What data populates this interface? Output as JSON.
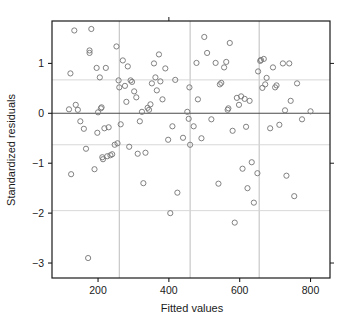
{
  "chart_data": {
    "type": "scatter",
    "title": "",
    "xlabel": "Fitted values",
    "ylabel": "Standardized residuals",
    "xlim": [
      70,
      855
    ],
    "ylim": [
      -3.3,
      1.85
    ],
    "xticks": [
      200,
      400,
      600,
      800
    ],
    "yticks": [
      1,
      0,
      -1,
      -2,
      -3
    ],
    "ytick_labels": [
      "1",
      "0",
      "−1",
      "−2",
      "−3"
    ],
    "xtick_labels": [
      "200",
      "400",
      "600",
      "800"
    ],
    "grid": true,
    "gridlines_v": [
      260,
      460,
      655
    ],
    "gridlines_h": [
      0.67,
      -0.63,
      -1.95
    ],
    "zero_line": 0,
    "legend": "none",
    "marker": "open-circle",
    "marker_color": "#7a7a7a",
    "marker_radius": 2.6,
    "points": [
      [
        118,
        0.08
      ],
      [
        124,
        -1.22
      ],
      [
        133,
        1.66
      ],
      [
        137,
        0.17
      ],
      [
        122,
        0.8
      ],
      [
        143,
        0.07
      ],
      [
        150,
        -0.16
      ],
      [
        160,
        -0.31
      ],
      [
        166,
        -0.71
      ],
      [
        172,
        -2.9
      ],
      [
        176,
        1.21
      ],
      [
        176,
        1.26
      ],
      [
        181,
        1.69
      ],
      [
        190,
        -1.12
      ],
      [
        196,
        0.91
      ],
      [
        198,
        -0.39
      ],
      [
        200,
        0.02
      ],
      [
        205,
        0.72
      ],
      [
        208,
        0.1
      ],
      [
        210,
        0.12
      ],
      [
        212,
        -0.88
      ],
      [
        214,
        -0.92
      ],
      [
        218,
        -0.3
      ],
      [
        222,
        0.91
      ],
      [
        226,
        -0.86
      ],
      [
        230,
        -0.28
      ],
      [
        235,
        -0.84
      ],
      [
        240,
        -0.82
      ],
      [
        247,
        -0.63
      ],
      [
        252,
        1.34
      ],
      [
        255,
        -0.6
      ],
      [
        258,
        0.66
      ],
      [
        260,
        0.52
      ],
      [
        264,
        -0.22
      ],
      [
        270,
        1.06
      ],
      [
        276,
        0.55
      ],
      [
        280,
        0.23
      ],
      [
        284,
        0.94
      ],
      [
        288,
        -0.67
      ],
      [
        292,
        0.66
      ],
      [
        296,
        0.63
      ],
      [
        302,
        0.44
      ],
      [
        308,
        0.32
      ],
      [
        312,
        -0.81
      ],
      [
        318,
        -0.16
      ],
      [
        324,
        0.03
      ],
      [
        328,
        -1.4
      ],
      [
        334,
        -0.79
      ],
      [
        340,
        0.11
      ],
      [
        344,
        0.07
      ],
      [
        348,
        0.18
      ],
      [
        352,
        0.6
      ],
      [
        358,
        1.0
      ],
      [
        362,
        0.72
      ],
      [
        366,
        0.46
      ],
      [
        372,
        1.18
      ],
      [
        376,
        0.64
      ],
      [
        382,
        0.28
      ],
      [
        390,
        0.9
      ],
      [
        398,
        -0.53
      ],
      [
        404,
        -2.0
      ],
      [
        410,
        -0.26
      ],
      [
        418,
        0.67
      ],
      [
        424,
        -1.59
      ],
      [
        440,
        -0.49
      ],
      [
        452,
        0.03
      ],
      [
        456,
        -0.11
      ],
      [
        458,
        0.52
      ],
      [
        460,
        -0.63
      ],
      [
        470,
        -0.26
      ],
      [
        478,
        1.01
      ],
      [
        482,
        0.28
      ],
      [
        492,
        -0.5
      ],
      [
        500,
        1.53
      ],
      [
        508,
        1.21
      ],
      [
        520,
        -0.12
      ],
      [
        532,
        1.01
      ],
      [
        540,
        -1.41
      ],
      [
        544,
        0.58
      ],
      [
        548,
        0.61
      ],
      [
        556,
        0.92
      ],
      [
        562,
        1.03
      ],
      [
        566,
        0.07
      ],
      [
        568,
        0.1
      ],
      [
        572,
        1.41
      ],
      [
        580,
        -0.35
      ],
      [
        586,
        -2.19
      ],
      [
        592,
        0.31
      ],
      [
        598,
        0.17
      ],
      [
        604,
        0.34
      ],
      [
        608,
        -1.11
      ],
      [
        614,
        0.29
      ],
      [
        618,
        -0.27
      ],
      [
        622,
        -1.5
      ],
      [
        628,
        0.25
      ],
      [
        634,
        -0.98
      ],
      [
        640,
        -1.79
      ],
      [
        650,
        -1.2
      ],
      [
        652,
        0.84
      ],
      [
        658,
        1.05
      ],
      [
        660,
        1.07
      ],
      [
        664,
        0.51
      ],
      [
        668,
        1.09
      ],
      [
        672,
        0.58
      ],
      [
        676,
        0.71
      ],
      [
        686,
        -0.3
      ],
      [
        694,
        0.92
      ],
      [
        700,
        0.52
      ],
      [
        704,
        0.56
      ],
      [
        712,
        -0.23
      ],
      [
        722,
        1.0
      ],
      [
        728,
        0.06
      ],
      [
        732,
        -1.25
      ],
      [
        740,
        1.0
      ],
      [
        744,
        0.25
      ],
      [
        754,
        -1.66
      ],
      [
        762,
        0.6
      ],
      [
        776,
        -0.12
      ],
      [
        800,
        0.04
      ]
    ]
  }
}
